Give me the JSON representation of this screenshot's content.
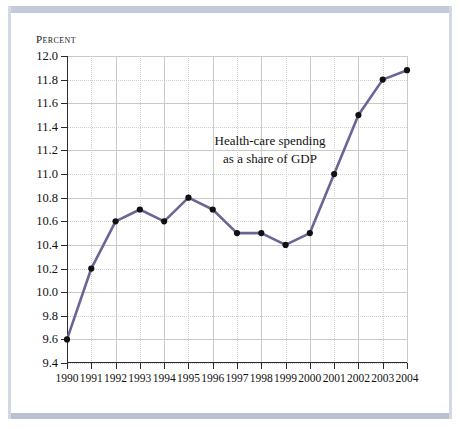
{
  "chart_data": {
    "type": "line",
    "title": "",
    "annotation": "Health-care spending\nas a share of GDP",
    "annotation_line1": "Health-care spending",
    "annotation_line2": "as a share of GDP",
    "xlabel": "",
    "ylabel": "Percent",
    "ylim": [
      9.4,
      12.0
    ],
    "ytick_step": 0.2,
    "xlim": [
      1990,
      2004
    ],
    "grid": true,
    "legend": "none",
    "line_color": "#6b6595",
    "marker_color": "#111111",
    "categories": [
      1990,
      1991,
      1992,
      1993,
      1994,
      1995,
      1996,
      1997,
      1998,
      1999,
      2000,
      2001,
      2002,
      2003,
      2004
    ],
    "xtick_labels": [
      "1990",
      "1991",
      "1992",
      "1993",
      "1994",
      "1995",
      "1996",
      "1997",
      "1998",
      "1999",
      "2000",
      "2001",
      "2002",
      "2003",
      "2004"
    ],
    "ytick_labels": [
      "12.0",
      "11.8",
      "11.6",
      "11.4",
      "11.2",
      "11.0",
      "10.8",
      "10.6",
      "10.4",
      "10.2",
      "10.0",
      "9.8",
      "9.6",
      "9.4"
    ],
    "ytick_values": [
      12.0,
      11.8,
      11.6,
      11.4,
      11.2,
      11.0,
      10.8,
      10.6,
      10.4,
      10.2,
      10.0,
      9.8,
      9.6,
      9.4
    ],
    "values": [
      9.6,
      10.2,
      10.6,
      10.7,
      10.6,
      10.8,
      10.7,
      10.5,
      10.5,
      10.4,
      10.5,
      11.0,
      11.5,
      11.8,
      11.88
    ],
    "series": [
      {
        "name": "Health-care spending as a share of GDP",
        "values": [
          9.6,
          10.2,
          10.6,
          10.7,
          10.6,
          10.8,
          10.7,
          10.5,
          10.5,
          10.4,
          10.5,
          11.0,
          11.5,
          11.8,
          11.88
        ]
      }
    ]
  }
}
